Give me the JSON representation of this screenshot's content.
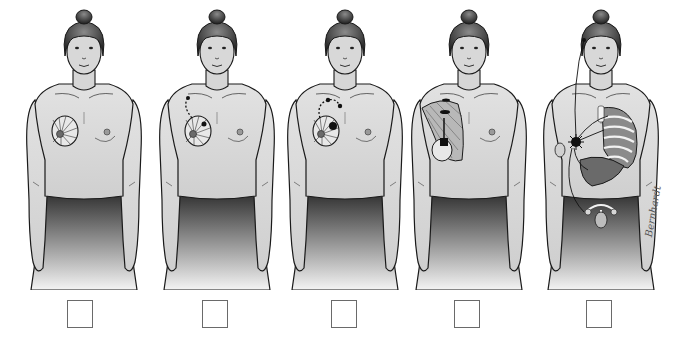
{
  "illustration": {
    "subject": "breast cancer progression stages",
    "figures": [
      {
        "stage": 1,
        "left": 15,
        "tumor_side": "right-breast",
        "detail": "localized tumor"
      },
      {
        "stage": 2,
        "left": 148,
        "tumor_side": "right-breast",
        "detail": "tumor with nearby lymph node spread"
      },
      {
        "stage": 3,
        "left": 276,
        "tumor_side": "right-breast",
        "detail": "tumor with regional lymph nodes"
      },
      {
        "stage": 4,
        "left": 400,
        "tumor_side": "right-breast",
        "detail": "spread into chest wall muscle"
      },
      {
        "stage": 5,
        "left": 532,
        "tumor_side": "right-breast",
        "detail": "metastasis to lungs, liver, bone, ovaries, brain"
      }
    ],
    "checkboxes": [
      {
        "left": 67,
        "checked": false
      },
      {
        "left": 202,
        "checked": false
      },
      {
        "left": 331,
        "checked": false
      },
      {
        "left": 454,
        "checked": false
      },
      {
        "left": 586,
        "checked": false
      }
    ],
    "signature": "Bernhardt"
  },
  "colors": {
    "skin": "#d9d9d9",
    "skin_shadow": "#bdbdbd",
    "outline": "#1a1a1a",
    "hair": "#3a3a3a",
    "skirt_top": "#2e2e2e",
    "skirt_bottom": "#f2f2f2",
    "tumor": "#111111",
    "organ": "#8a8a8a"
  }
}
